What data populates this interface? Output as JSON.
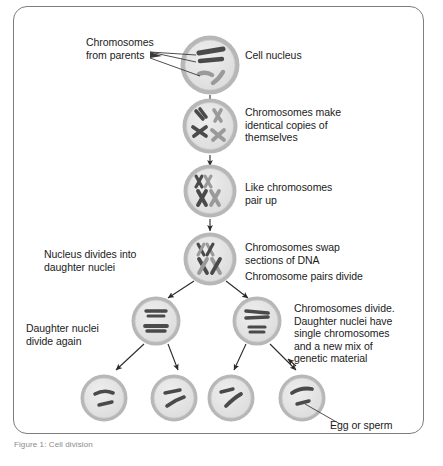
{
  "figure": {
    "caption": "Figure 1: Cell division",
    "border_color": "#7d7d7d",
    "background": "#ffffff"
  },
  "colors": {
    "nucleus_fill": "#e2e2e2",
    "nucleus_rim": "#b7b7b7",
    "chromosome_dark": "#4a4a4a",
    "chromosome_light": "#9a9a9a",
    "text": "#1b1b1b",
    "arrow": "#2a2a2a",
    "leader": "#3a3a3a"
  },
  "labels": {
    "chromosomes_from_parents": "Chromosomes\nfrom parents",
    "cell_nucleus": "Cell nucleus",
    "chromosomes_make_copies": "Chromosomes make\nidentical copies of\nthemselves",
    "like_chromosomes_pair_up": "Like chromosomes\npair up",
    "chromosomes_swap_dna": "Chromosomes swap\nsections of DNA",
    "nucleus_divides": "Nucleus divides into\ndaughter nuclei",
    "chromosome_pairs_divide": "Chromosome pairs divide",
    "daughter_nuclei_divide_again": "Daughter nuclei\ndivide again",
    "chromosomes_divide_detail": "Chromosomes divide.\nDaughter nuclei have\nsingle chromosomes\nand a new mix of\ngenetic material",
    "egg_or_sperm": "Egg or sperm"
  },
  "stages": [
    {
      "id": "stage-1-parent-nucleus",
      "name": "Cell nucleus with chromosomes from parents",
      "cx": 210,
      "cy": 65,
      "r": 30,
      "chromosome_count": 4
    },
    {
      "id": "stage-2-replication",
      "name": "Chromosomes make identical copies of themselves",
      "cx": 210,
      "cy": 125,
      "r": 28,
      "chromosome_count": 4
    },
    {
      "id": "stage-3-pairing",
      "name": "Like chromosomes pair up",
      "cx": 210,
      "cy": 190,
      "r": 27,
      "chromosome_count": 4
    },
    {
      "id": "stage-4-crossing-over",
      "name": "Chromosomes swap sections of DNA",
      "cx": 210,
      "cy": 258,
      "r": 27,
      "chromosome_count": 4
    },
    {
      "id": "stage-5-daughter-nucleus-left",
      "name": "Daughter nucleus left",
      "cx": 156,
      "cy": 320,
      "r": 25,
      "chromosome_count": 2
    },
    {
      "id": "stage-5-daughter-nucleus-right",
      "name": "Daughter nucleus right",
      "cx": 257,
      "cy": 320,
      "r": 25,
      "chromosome_count": 2
    },
    {
      "id": "stage-6-gamete-1",
      "name": "Gamete 1",
      "cx": 104,
      "cy": 398,
      "r": 24,
      "chromosome_count": 2
    },
    {
      "id": "stage-6-gamete-2",
      "name": "Gamete 2",
      "cx": 174,
      "cy": 398,
      "r": 24,
      "chromosome_count": 2
    },
    {
      "id": "stage-6-gamete-3",
      "name": "Gamete 3",
      "cx": 231,
      "cy": 398,
      "r": 24,
      "chromosome_count": 2
    },
    {
      "id": "stage-6-gamete-4",
      "name": "Gamete 4 (egg or sperm)",
      "cx": 302,
      "cy": 398,
      "r": 24,
      "chromosome_count": 2
    }
  ]
}
